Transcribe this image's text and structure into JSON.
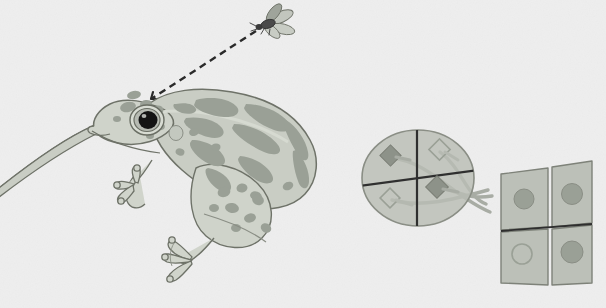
{
  "figure": {
    "title": "Frog visual system: retinotopic projection from retina to optic tectum",
    "background_color": "#eeeeee",
    "width": 606,
    "height": 308
  },
  "palette": {
    "background": "#eeeeee",
    "body_fill": "#c9cdc4",
    "body_fill_light": "#d4d8cf",
    "spot_fill": "#9aa096",
    "outline": "#6e7268",
    "outline_dark": "#5a5f56",
    "eye_ring": "#6a6e64",
    "pupil": "#1a1a1a",
    "fly_body": "#4a4a4a",
    "fly_wing": "#b8bcb4",
    "sight_line": "#2a2a2a",
    "retina_fill": "#b9bdb5",
    "retina_outline": "#8a8e85",
    "axis_line": "#2f2f2f",
    "cell_fill": "#8d9289",
    "cell_outline": "#7a7e75",
    "axon": "#a8aca4",
    "tectum_fill": "#bcc0b8",
    "tectum_outline": "#7e8279",
    "target_fill": "#9aa096",
    "target_outline": "#8a8e85"
  },
  "scene": {
    "animal": {
      "name": "frog",
      "species_pattern": "leopard-frog-spots",
      "pose": "crouching, facing left, tongue extended"
    },
    "prey": {
      "name": "fly",
      "wing_count": 4,
      "position": "upper right of frog"
    },
    "sight_line": {
      "name": "line-of-sight",
      "style": "dashed",
      "from": "fly",
      "to": "frog-eye"
    }
  },
  "retina": {
    "label": "retina",
    "shape": "ellipse",
    "quadrant_count": 4,
    "cells": [
      {
        "quadrant": "upper-left",
        "style": "filled",
        "shape": "diamond"
      },
      {
        "quadrant": "upper-right",
        "style": "outlined",
        "shape": "diamond"
      },
      {
        "quadrant": "lower-left",
        "style": "outlined",
        "shape": "diamond"
      },
      {
        "quadrant": "lower-right",
        "style": "filled",
        "shape": "diamond"
      }
    ]
  },
  "tectum": {
    "label": "optic tectum",
    "grid": {
      "rows": 2,
      "cols": 2
    },
    "panels": [
      {
        "position": "upper-left",
        "target_style": "filled"
      },
      {
        "position": "upper-right",
        "target_style": "filled"
      },
      {
        "position": "lower-left",
        "target_style": "outlined"
      },
      {
        "position": "lower-right",
        "target_style": "filled"
      }
    ]
  },
  "projection": {
    "label": "retinotectal axon projection",
    "axon_count": 4,
    "crossing": true,
    "description": "axons from retinal quadrants cross to map onto inverted tectal quadrants"
  }
}
